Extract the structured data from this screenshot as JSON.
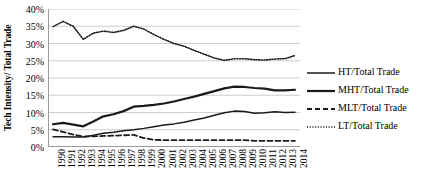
{
  "chart_data": {
    "type": "line",
    "title": "",
    "xlabel": "",
    "ylabel": "Tech Intensity/ Total Trade",
    "ylim": [
      0,
      40
    ],
    "ytick_labels": [
      "0%",
      "5%",
      "10%",
      "15%",
      "20%",
      "25%",
      "30%",
      "35%",
      "40%"
    ],
    "ytick_values": [
      0,
      5,
      10,
      15,
      20,
      25,
      30,
      35,
      40
    ],
    "grid": "horizontal",
    "legend_position": "right",
    "categories": [
      "1990",
      "1991",
      "1992",
      "1993",
      "1994",
      "1995",
      "1996",
      "1997",
      "1998",
      "1999",
      "2000",
      "2001",
      "2002",
      "2003",
      "2004",
      "2005",
      "2006",
      "2007",
      "2008",
      "2009",
      "2010",
      "2011",
      "2012",
      "2013",
      "2014"
    ],
    "series": [
      {
        "name": "HT/Total Trade",
        "style": "solid-thin",
        "color": "#1a1a1a",
        "values": [
          3.0,
          3.0,
          2.9,
          2.9,
          3.4,
          4.0,
          4.3,
          4.7,
          5.0,
          5.4,
          5.9,
          6.4,
          6.7,
          7.2,
          7.8,
          8.4,
          9.2,
          9.9,
          10.4,
          10.3,
          9.8,
          9.9,
          10.2,
          10.0,
          10.1
        ]
      },
      {
        "name": "MHT/Total Trade",
        "style": "solid-thick",
        "color": "#1a1a1a",
        "values": [
          6.6,
          7.0,
          6.5,
          6.0,
          7.4,
          8.9,
          9.5,
          10.4,
          11.7,
          11.9,
          12.2,
          12.6,
          13.2,
          13.9,
          14.6,
          15.4,
          16.2,
          17.0,
          17.5,
          17.4,
          17.1,
          16.9,
          16.4,
          16.4,
          16.6
        ]
      },
      {
        "name": "MLT/Total Trade",
        "style": "dashed",
        "color": "#1a1a1a",
        "values": [
          5.1,
          4.4,
          3.6,
          3.0,
          3.1,
          3.2,
          3.3,
          3.4,
          3.5,
          2.6,
          2.1,
          2.0,
          2.0,
          2.0,
          2.0,
          2.0,
          2.0,
          2.0,
          2.0,
          2.0,
          1.8,
          1.8,
          1.8,
          1.8,
          1.8
        ]
      },
      {
        "name": "LT/Total Trade",
        "style": "dotted",
        "color": "#1a1a1a",
        "values": [
          34.9,
          36.4,
          35.0,
          31.2,
          33.0,
          33.6,
          33.2,
          33.8,
          35.0,
          34.2,
          32.6,
          31.2,
          30.0,
          29.2,
          28.0,
          26.9,
          25.8,
          25.1,
          25.6,
          25.6,
          25.3,
          25.2,
          25.5,
          25.6,
          26.5
        ]
      }
    ]
  },
  "legend": {
    "items": [
      {
        "label": "HT/Total Trade",
        "style": "solid-thin"
      },
      {
        "label": "MHT/Total Trade",
        "style": "solid-thick"
      },
      {
        "label": "MLT/Total Trade",
        "style": "dashed"
      },
      {
        "label": "LT/Total Trade",
        "style": "dotted"
      }
    ]
  },
  "colors": {
    "line": "#1a1a1a",
    "grid": "#b7b7b7",
    "axis": "#9a9a9a",
    "background": "#ffffff"
  }
}
